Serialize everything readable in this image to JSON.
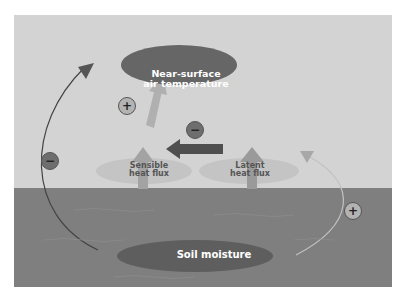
{
  "diagram": {
    "nodes": {
      "air_temperature": {
        "label_line1": "Near-surface",
        "label_line2": "air temperature"
      },
      "soil_moisture": {
        "label": "Soil moisture"
      }
    },
    "fluxes": {
      "sensible": {
        "label_line1": "Sensible",
        "label_line2": "heat flux"
      },
      "latent": {
        "label_line1": "Latent",
        "label_line2": "heat flux"
      }
    },
    "signs": {
      "left_loop": "−",
      "sensible_to_air": "+",
      "latent_to_sensible": "−",
      "right_loop": "+"
    },
    "colors": {
      "sky": "#d3d3d3",
      "ground": "#7f7f7f",
      "node_fill": "#666666",
      "flux_ellipse": "#c4c4c4",
      "flux_arrow": "#a0a0a0",
      "dark_arrow": "#4f4f4f"
    }
  }
}
